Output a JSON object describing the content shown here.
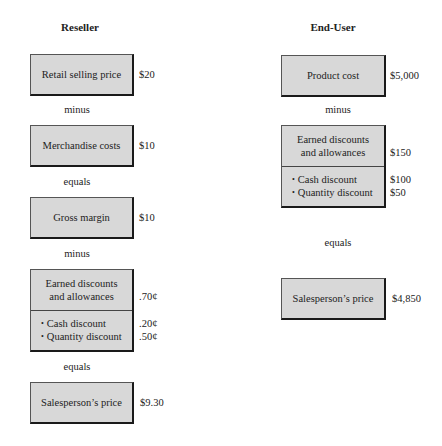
{
  "reseller": {
    "title": "Reseller",
    "steps": [
      {
        "label": "Retail selling price",
        "value": "$20"
      },
      {
        "connector": "minus"
      },
      {
        "label": "Merchandise costs",
        "value": "$10"
      },
      {
        "connector": "equals"
      },
      {
        "label": "Gross margin",
        "value": "$10"
      },
      {
        "connector": "minus"
      },
      {
        "label_line1": "Earned discounts",
        "label_line2": "and allowances",
        "value": ".70¢",
        "items": [
          {
            "label": "Cash discount",
            "value": ".20¢"
          },
          {
            "label": "Quantity discount",
            "value": ".50¢"
          }
        ]
      },
      {
        "connector": "equals"
      },
      {
        "label": "Salesperson’s price",
        "value": "$9.30"
      }
    ]
  },
  "end_user": {
    "title": "End-User",
    "steps": [
      {
        "label": "Product cost",
        "value": "$5,000"
      },
      {
        "connector": "minus"
      },
      {
        "label_line1": "Earned discounts",
        "label_line2": "and allowances",
        "value": "$150",
        "items": [
          {
            "label": "Cash discount",
            "value": "$100"
          },
          {
            "label": "Quantity discount",
            "value": "$50"
          }
        ]
      },
      {
        "connector": "equals"
      },
      {
        "label": "Salesperson’s price",
        "value": "$4,850"
      }
    ]
  },
  "bullet_symbol": "•",
  "colors": {
    "box_fill": "#d8d8d8",
    "box_border": "#1a1a1a",
    "text": "#222222"
  }
}
